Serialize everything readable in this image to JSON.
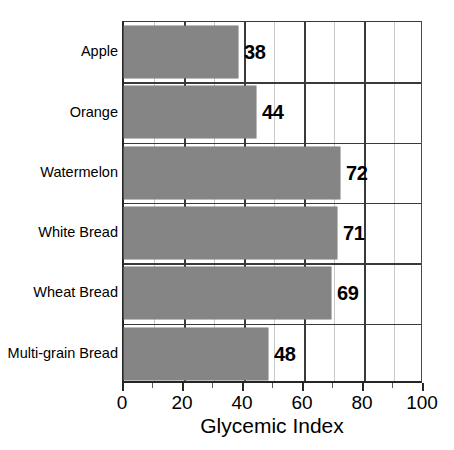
{
  "chart_data": {
    "type": "bar",
    "orientation": "horizontal",
    "title": "",
    "xlabel": "Glycemic Index",
    "ylabel": "",
    "xlim": [
      0,
      100
    ],
    "grid": true,
    "legend": null,
    "categories": [
      "Apple",
      "Orange",
      "Watermelon",
      "White Bread",
      "Wheat Bread",
      "Multi-grain Bread"
    ],
    "values": [
      38,
      44,
      72,
      71,
      69,
      48
    ],
    "value_labels": [
      "38",
      "44",
      "72",
      "71",
      "69",
      "48"
    ],
    "x_ticks_major": [
      0,
      20,
      40,
      60,
      80,
      100
    ],
    "x_ticks_minor": [
      10,
      30,
      50,
      70,
      90
    ],
    "x_tick_labels": [
      "0",
      "20",
      "40",
      "60",
      "80",
      "100"
    ],
    "colors": {
      "bar_fill": "#858585",
      "axis": "#262626",
      "gridline_major": "#3a3a3a",
      "gridline_minor": "#c9c9c9",
      "text": "#000000",
      "background": "#ffffff"
    }
  }
}
